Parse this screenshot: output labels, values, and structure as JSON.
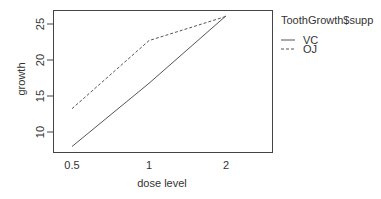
{
  "chart_data": {
    "type": "line",
    "title": "",
    "xlabel": "dose level",
    "ylabel": "growth",
    "categories": [
      "0.5",
      "1",
      "2"
    ],
    "series": [
      {
        "name": "VC",
        "values": [
          7.98,
          16.77,
          26.14
        ],
        "line_style": "solid"
      },
      {
        "name": "OJ",
        "values": [
          13.23,
          22.7,
          26.06
        ],
        "line_style": "dashed"
      }
    ],
    "y_ticks": [
      "10",
      "15",
      "20",
      "25"
    ],
    "ylim": [
      7.3,
      26.9
    ],
    "grid": false,
    "legend": {
      "title": "ToothGrowth$supp",
      "position": "right-top",
      "entries": [
        "VC",
        "OJ"
      ]
    }
  },
  "colors": {
    "line": "#555555",
    "axis": "#444444",
    "text": "#333333",
    "background": "#ffffff"
  }
}
